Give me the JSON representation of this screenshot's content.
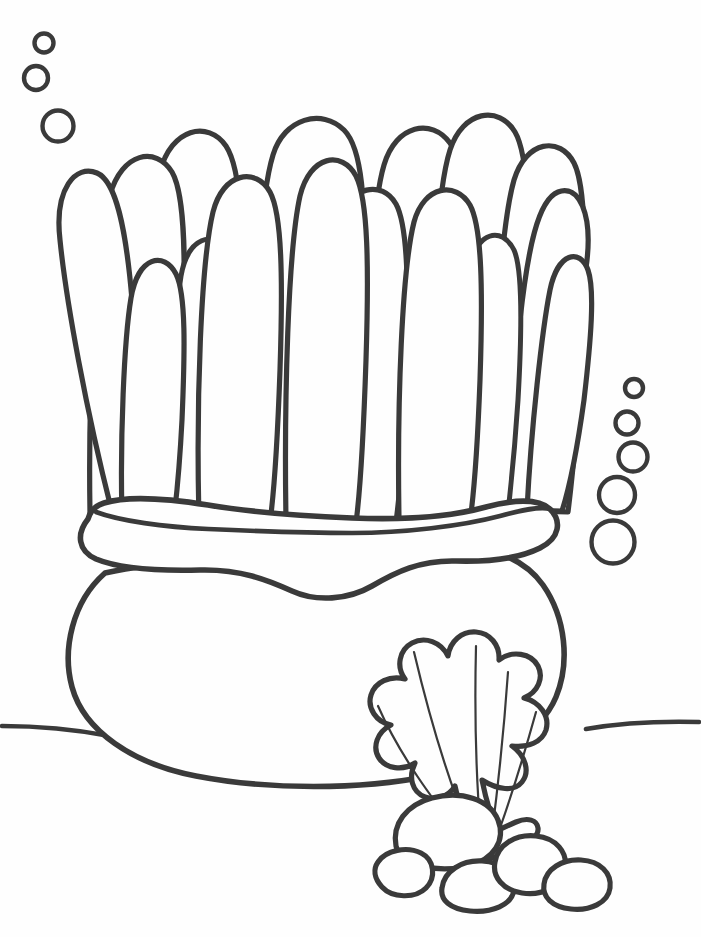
{
  "document": {
    "kind": "coloring-page",
    "title": "Sea Anemone Coloring Page",
    "subject": "sea anemone with scallop shell and pebbles on the sea floor",
    "width": 701,
    "height": 937,
    "background_color": "#fefefe",
    "line_color": "#3a3a3a",
    "style": "black-and-white line art, unfilled outlines"
  },
  "palette": {
    "ink": "#3a3a3a",
    "paper": "#fefefe"
  },
  "scene": {
    "elements": [
      "bubble-cluster-left",
      "bubble-cluster-right",
      "anemone-tentacles",
      "anemone-collar",
      "anemone-body",
      "sea-floor-line",
      "scallop-shell",
      "pebble-group"
    ]
  },
  "bubbles": {
    "left_cluster": {
      "name": "bubble-cluster-left",
      "count": 3,
      "items": [
        {
          "cx": 44,
          "cy": 43,
          "r": 9.5
        },
        {
          "cx": 36,
          "cy": 78,
          "r": 12.0
        },
        {
          "cx": 58,
          "cy": 126,
          "r": 15.5
        }
      ]
    },
    "right_cluster": {
      "name": "bubble-cluster-right",
      "count": 5,
      "items": [
        {
          "cx": 634,
          "cy": 388,
          "r": 9.0
        },
        {
          "cx": 627,
          "cy": 423,
          "r": 11.5
        },
        {
          "cx": 633,
          "cy": 457,
          "r": 14.5
        },
        {
          "cx": 617,
          "cy": 495,
          "r": 18.0
        },
        {
          "cx": 613,
          "cy": 542,
          "r": 21.5
        }
      ]
    }
  },
  "anemone": {
    "tentacle_count": 16,
    "collar_label": "wavy oral disc rim",
    "body_label": "column / foot",
    "tentacles": [
      {
        "id": 1,
        "tip_x": 152,
        "tip_y": 282,
        "note": "outermost left, curves outward"
      },
      {
        "id": 2,
        "tip_x": 252,
        "tip_y": 152,
        "note": "tall left"
      },
      {
        "id": 3,
        "tip_x": 319,
        "tip_y": 456,
        "note": "short front left"
      },
      {
        "id": 4,
        "tip_x": 376,
        "tip_y": 118,
        "note": "tallest left of center"
      },
      {
        "id": 5,
        "tip_x": 404,
        "tip_y": 283,
        "note": "behind, narrow"
      },
      {
        "id": 6,
        "tip_x": 489,
        "tip_y": 160,
        "note": "center left"
      },
      {
        "id": 7,
        "tip_x": 616,
        "tip_y": 108,
        "note": "tallest center"
      },
      {
        "id": 8,
        "tip_x": 632,
        "tip_y": 190,
        "note": "center"
      },
      {
        "id": 9,
        "tip_x": 741,
        "tip_y": 208,
        "note": "center right"
      },
      {
        "id": 10,
        "tip_x": 843,
        "tip_y": 125,
        "note": "tall right of center"
      },
      {
        "id": 11,
        "tip_x": 963,
        "tip_y": 205,
        "note": "right"
      },
      {
        "id": 12,
        "tip_x": 1001,
        "tip_y": 95,
        "note": "tall far right"
      },
      {
        "id": 13,
        "tip_x": 1026,
        "tip_y": 258,
        "note": "right inner"
      },
      {
        "id": 14,
        "tip_x": 1160,
        "tip_y": 135,
        "note": "far right tall"
      },
      {
        "id": 15,
        "tip_x": 1266,
        "tip_y": 246,
        "note": "far right short"
      },
      {
        "id": 16,
        "tip_x": 1313,
        "tip_y": 354,
        "note": "outermost right, curves down"
      }
    ]
  },
  "sea_floor": {
    "name": "sea-floor-line",
    "left_segment": {
      "x1": 0,
      "y1": 726,
      "x2": 108,
      "y2": 734
    },
    "right_segment": {
      "x1": 585,
      "y1": 728,
      "x2": 701,
      "y2": 722
    }
  },
  "shell": {
    "name": "scallop-shell",
    "lobe_count": 9,
    "rib_count": 5,
    "hinge_label": "hinge",
    "bounds": {
      "x": 368,
      "y": 676,
      "w": 220,
      "h": 160
    }
  },
  "pebbles": {
    "name": "pebble-group",
    "count": 5,
    "items": [
      {
        "id": 1,
        "cx": 448,
        "cy": 830,
        "rx": 53,
        "ry": 34,
        "note": "large upper left"
      },
      {
        "id": 2,
        "cx": 404,
        "cy": 869,
        "rx": 27,
        "ry": 22,
        "note": "small far left"
      },
      {
        "id": 3,
        "cx": 478,
        "cy": 885,
        "rx": 36,
        "ry": 25,
        "note": "small center"
      },
      {
        "id": 4,
        "cx": 527,
        "cy": 862,
        "rx": 33,
        "ry": 26,
        "note": "medium right"
      },
      {
        "id": 5,
        "cx": 573,
        "cy": 885,
        "rx": 31,
        "ry": 23,
        "note": "small far right"
      }
    ]
  }
}
